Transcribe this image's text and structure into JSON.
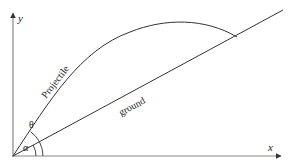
{
  "diagram": {
    "type": "projectile-on-inclined-plane",
    "axes": {
      "x_label": "x",
      "y_label": "y"
    },
    "labels": {
      "trajectory": "Projectile",
      "incline": "ground",
      "launch_angle": "θ",
      "incline_angle": "α"
    },
    "colors": {
      "stroke": "#333333",
      "axis": "#888888",
      "text": "#222222",
      "background": "#ffffff"
    }
  }
}
